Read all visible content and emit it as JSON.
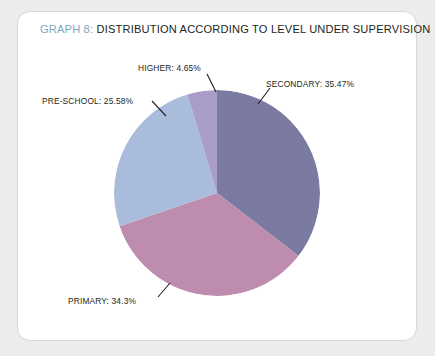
{
  "card": {
    "title_prefix": "GRAPH 8:",
    "title_text": " DISTRIBUTION ACCORDING TO LEVEL UNDER SUPERVISION"
  },
  "labels": {
    "higher": "HIGHER: 4.65%",
    "secondary": "SECONDARY: 35.47%",
    "preschool": "PRE-SCHOOL: 25.58%",
    "primary": "PRIMARY: 34.3%"
  },
  "colors": {
    "secondary": "#7b7ba2",
    "primary": "#bd8cae",
    "preschool": "#a9bcdb",
    "higher": "#a99cc6",
    "title_accent": "#7fa8bd",
    "text": "#231f20",
    "card_bg": "#ffffff",
    "page_bg": "#ececec",
    "leader_line": "#231f20"
  },
  "chart_data": {
    "type": "pie",
    "title": "GRAPH 8: DISTRIBUTION ACCORDING TO LEVEL UNDER SUPERVISION",
    "xlabel": "",
    "ylabel": "",
    "legend_position": "none",
    "grid": false,
    "start_angle_deg": 0,
    "direction": "clockwise",
    "categories": [
      "SECONDARY",
      "PRIMARY",
      "PRE-SCHOOL",
      "HIGHER"
    ],
    "values": [
      35.47,
      34.3,
      25.58,
      4.65
    ],
    "units": "percent",
    "slices": [
      {
        "name": "SECONDARY",
        "value": 35.47,
        "color": "#7b7ba2",
        "label": "SECONDARY: 35.47%"
      },
      {
        "name": "PRIMARY",
        "value": 34.3,
        "color": "#bd8cae",
        "label": "PRIMARY: 34.3%"
      },
      {
        "name": "PRE-SCHOOL",
        "value": 25.58,
        "color": "#a9bcdb",
        "label": "PRE-SCHOOL: 25.58%"
      },
      {
        "name": "HIGHER",
        "value": 4.65,
        "color": "#a99cc6",
        "label": "HIGHER: 4.65%"
      }
    ]
  }
}
